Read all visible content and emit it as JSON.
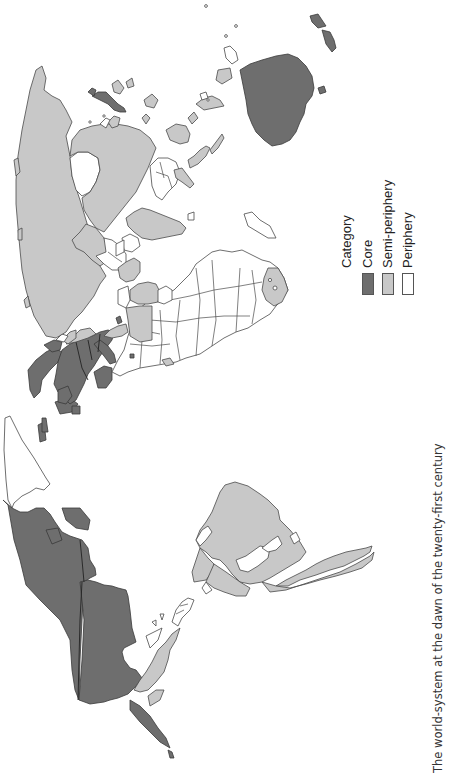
{
  "figure": {
    "caption": "The world-system at the dawn of the twenty-first century",
    "orientation": "rotated 90° clockwise (north points left)"
  },
  "legend": {
    "title": "Category",
    "items": [
      {
        "label": "Core",
        "color": "#6e6e6e"
      },
      {
        "label": "Semi-periphery",
        "color": "#c8c8c8"
      },
      {
        "label": "Periphery",
        "color": "#ffffff"
      }
    ]
  },
  "regions": {
    "core": [
      "Canada",
      "United States",
      "Western Europe",
      "Scandinavia",
      "Japan",
      "Australia",
      "New Zealand",
      "Israel"
    ],
    "semi_periphery": [
      "Russia",
      "China",
      "India",
      "Mexico",
      "Brazil",
      "Argentina",
      "Chile",
      "Venezuela",
      "Colombia",
      "South Africa",
      "Saudi Arabia",
      "Turkey",
      "Eastern Europe",
      "Indonesia",
      "Malaysia",
      "South Korea",
      "Taiwan",
      "Kazakhstan",
      "Iran",
      "Egypt",
      "Philippines"
    ],
    "periphery": [
      "Greenland",
      "Africa (most)",
      "Central Asia",
      "Southeast Asia (part)",
      "Central America",
      "Bolivia",
      "Paraguay",
      "Caribbean"
    ]
  }
}
